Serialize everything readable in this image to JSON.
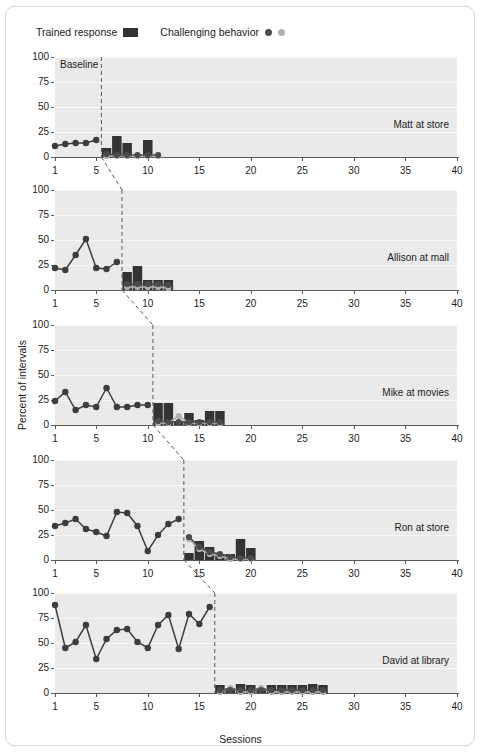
{
  "legend": {
    "trained_label": "Trained response",
    "trained_marker": "bar-swatch-dark",
    "challenging_label": "Challenging behavior",
    "challenging_marker_dark": "dot-dark",
    "challenging_marker_light": "dot-light"
  },
  "axes": {
    "ylabel": "Percent of intervals",
    "xlabel": "Sessions",
    "yticks": [
      0,
      25,
      50,
      75,
      100
    ],
    "xticks": [
      1,
      5,
      10,
      15,
      20,
      25,
      30,
      35,
      40
    ],
    "xlim": [
      1,
      40
    ],
    "ylim": [
      0,
      100
    ],
    "baseline_annotation": "Baseline"
  },
  "colors": {
    "bar_dark": "#333333",
    "dot_dark": "#4b4b4b",
    "dot_light": "#b0b0b0",
    "line_dark": "#3d3d3d",
    "panel_bg": "#eaeaea",
    "grid": "#f7f7f7",
    "axis": "#5a5a5a",
    "frame_border": "#d9d9d9",
    "page_bg": "#ffffff"
  },
  "chart_data": {
    "type": "line",
    "title": "",
    "xlabel": "Sessions",
    "ylabel": "Percent of intervals",
    "xlim": [
      1,
      40
    ],
    "ylim": [
      0,
      100
    ],
    "grid": true,
    "legend_position": "top-left",
    "panels": [
      {
        "label": "Matt at store",
        "phase_change_session": 5.5,
        "baseline": {
          "name": "Baseline trained response",
          "x": [
            1,
            2,
            3,
            4,
            5
          ],
          "y": [
            11,
            13,
            14,
            14,
            17
          ]
        },
        "intervention_bars": {
          "name": "Trained response",
          "x": [
            6,
            7,
            8,
            9,
            10,
            11
          ],
          "y": [
            9,
            21,
            14,
            0,
            17,
            0
          ]
        },
        "intervention_challenging_dark": {
          "name": "Challenging behavior",
          "x": [
            6,
            7,
            8,
            9,
            10,
            11
          ],
          "y": [
            3,
            2,
            2,
            2,
            2,
            2
          ]
        },
        "intervention_challenging_light": {
          "name": "Challenging behavior (secondary)",
          "x": [
            6,
            7,
            8,
            9,
            10,
            11
          ],
          "y": [
            1,
            1,
            1,
            1,
            1,
            1
          ]
        }
      },
      {
        "label": "Allison at mall",
        "phase_change_session": 7.5,
        "baseline": {
          "name": "Baseline trained response",
          "x": [
            1,
            2,
            3,
            4,
            5,
            6,
            7
          ],
          "y": [
            22,
            20,
            35,
            51,
            22,
            21,
            28
          ]
        },
        "intervention_bars": {
          "name": "Trained response",
          "x": [
            8,
            9,
            10,
            11,
            12
          ],
          "y": [
            18,
            24,
            10,
            10,
            10
          ]
        },
        "intervention_challenging_dark": {
          "name": "Challenging behavior",
          "x": [
            8,
            9,
            10,
            11,
            12
          ],
          "y": [
            6,
            6,
            6,
            6,
            5
          ]
        },
        "intervention_challenging_light": {
          "name": "Challenging behavior (secondary)",
          "x": [
            8,
            9,
            10,
            11,
            12
          ],
          "y": [
            3,
            3,
            3,
            3,
            2
          ]
        }
      },
      {
        "label": "Mike at movies",
        "phase_change_session": 10.5,
        "baseline": {
          "name": "Baseline trained response",
          "x": [
            1,
            2,
            3,
            4,
            5,
            6,
            7,
            8,
            9,
            10
          ],
          "y": [
            24,
            33,
            15,
            20,
            18,
            37,
            18,
            18,
            20,
            20
          ]
        },
        "intervention_bars": {
          "name": "Trained response",
          "x": [
            11,
            12,
            13,
            14,
            15,
            16,
            17
          ],
          "y": [
            22,
            22,
            4,
            12,
            5,
            14,
            14
          ]
        },
        "intervention_challenging_dark": {
          "name": "Challenging behavior",
          "x": [
            11,
            12,
            13,
            14,
            15,
            16,
            17
          ],
          "y": [
            4,
            3,
            3,
            3,
            3,
            3,
            3
          ]
        },
        "intervention_challenging_light": {
          "name": "Challenging behavior (secondary)",
          "x": [
            11,
            12,
            13,
            14,
            15,
            16,
            17
          ],
          "y": [
            2,
            2,
            9,
            2,
            2,
            2,
            2
          ]
        }
      },
      {
        "label": "Ron at store",
        "phase_change_session": 13.5,
        "baseline": {
          "name": "Baseline trained response",
          "x": [
            1,
            2,
            3,
            4,
            5,
            6,
            7,
            8,
            9,
            10,
            11,
            12,
            13
          ],
          "y": [
            34,
            37,
            41,
            31,
            28,
            24,
            48,
            47,
            34,
            9,
            25,
            36,
            41
          ]
        },
        "intervention_bars": {
          "name": "Trained response",
          "x": [
            14,
            15,
            16,
            17,
            18,
            19,
            20
          ],
          "y": [
            7,
            19,
            13,
            6,
            6,
            21,
            12
          ]
        },
        "intervention_challenging_dark": {
          "name": "Challenging behavior",
          "x": [
            14,
            15,
            16,
            17,
            18,
            19,
            20
          ],
          "y": [
            23,
            13,
            8,
            6,
            3,
            2,
            2
          ]
        },
        "intervention_challenging_light": {
          "name": "Challenging behavior (secondary)",
          "x": [
            14,
            15,
            16,
            17,
            18,
            19,
            20
          ],
          "y": [
            21,
            11,
            6,
            4,
            1,
            1,
            1
          ]
        }
      },
      {
        "label": "David at library",
        "phase_change_session": 16.5,
        "baseline": {
          "name": "Baseline trained response",
          "x": [
            1,
            2,
            3,
            4,
            5,
            6,
            7,
            8,
            9,
            10,
            11,
            12,
            13,
            14,
            15,
            16
          ],
          "y": [
            88,
            45,
            51,
            68,
            34,
            54,
            63,
            64,
            51,
            45,
            68,
            78,
            44,
            79,
            69,
            86
          ]
        },
        "intervention_bars": {
          "name": "Trained response",
          "x": [
            17,
            18,
            19,
            20,
            21,
            22,
            23,
            24,
            25,
            26,
            27
          ],
          "y": [
            8,
            5,
            9,
            8,
            5,
            8,
            8,
            8,
            8,
            9,
            8
          ]
        },
        "intervention_challenging_dark": {
          "name": "Challenging behavior",
          "x": [
            17,
            18,
            19,
            20,
            21,
            22,
            23,
            24,
            25,
            26,
            27
          ],
          "y": [
            3,
            3,
            3,
            3,
            3,
            3,
            3,
            3,
            3,
            3,
            3
          ]
        },
        "intervention_challenging_light": {
          "name": "Challenging behavior (secondary)",
          "x": [
            17,
            18,
            19,
            20,
            21,
            22,
            23,
            24,
            25,
            26,
            27
          ],
          "y": [
            1,
            5,
            1,
            1,
            5,
            1,
            1,
            1,
            1,
            1,
            1
          ]
        }
      }
    ]
  }
}
